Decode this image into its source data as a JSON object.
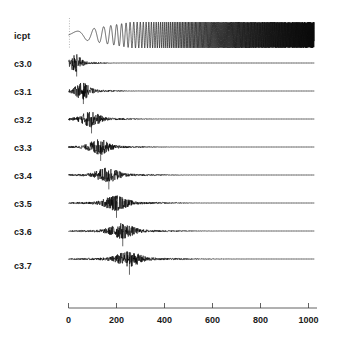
{
  "chart_data": {
    "type": "line",
    "title": "",
    "subtitle": "",
    "xlabel": "",
    "ylabel": "",
    "grid": false,
    "legend_position": "left-row-labels",
    "xlim": [
      0,
      1024
    ],
    "x_ticks": [
      0,
      200,
      400,
      600,
      800,
      1000
    ],
    "x_tick_labels": [
      "0",
      "200",
      "400",
      "600",
      "800",
      "1000"
    ],
    "panel_labels": [
      "icpt",
      "c3.0",
      "c3.1",
      "c3.2",
      "c3.3",
      "c3.4",
      "c3.5",
      "c3.6",
      "c3.7"
    ],
    "n_panels": 9,
    "series": [
      {
        "name": "icpt",
        "kind": "chirp",
        "x_start": 0,
        "x_end": 1024,
        "amplitude": 1.0,
        "freq_start": 0.006,
        "freq_end": 0.49,
        "has_vertical_marker": true,
        "vertical_marker_x": 4
      },
      {
        "name": "c3.0",
        "kind": "burst",
        "burst_center": 30,
        "burst_width": 48,
        "tail_end": 1024,
        "amplitude": 1.0,
        "spike_x": 34,
        "spike_depth": 1.5
      },
      {
        "name": "c3.1",
        "kind": "burst",
        "burst_center": 58,
        "burst_width": 62,
        "tail_end": 1024,
        "amplitude": 0.95,
        "spike_x": 62,
        "spike_depth": 1.45
      },
      {
        "name": "c3.2",
        "kind": "burst",
        "burst_center": 92,
        "burst_width": 78,
        "tail_end": 1024,
        "amplitude": 0.92,
        "spike_x": 96,
        "spike_depth": 1.6
      },
      {
        "name": "c3.3",
        "kind": "burst",
        "burst_center": 128,
        "burst_width": 86,
        "tail_end": 1024,
        "amplitude": 0.9,
        "spike_x": 134,
        "spike_depth": 1.55
      },
      {
        "name": "c3.4",
        "kind": "burst",
        "burst_center": 162,
        "burst_width": 94,
        "tail_end": 1024,
        "amplitude": 0.9,
        "spike_x": 168,
        "spike_depth": 1.6
      },
      {
        "name": "c3.5",
        "kind": "burst",
        "burst_center": 196,
        "burst_width": 100,
        "tail_end": 1024,
        "amplitude": 0.88,
        "spike_x": 200,
        "spike_depth": 1.65
      },
      {
        "name": "c3.6",
        "kind": "burst",
        "burst_center": 222,
        "burst_width": 104,
        "tail_end": 1024,
        "amplitude": 0.88,
        "spike_x": 226,
        "spike_depth": 1.7
      },
      {
        "name": "c3.7",
        "kind": "burst",
        "burst_center": 250,
        "burst_width": 112,
        "tail_end": 1024,
        "amplitude": 0.85,
        "spike_x": 254,
        "spike_depth": 1.75
      }
    ]
  },
  "colors": {
    "background": "#ffffff",
    "trace": "#000000",
    "baseline": "#8a8a8a",
    "axis": "#3a3a3a",
    "label": "#1a1a1a"
  },
  "axis": {
    "tick_labels": [
      "0",
      "200",
      "400",
      "600",
      "800",
      "1000"
    ]
  },
  "labels": {
    "icpt": "icpt",
    "c30": "c3.0",
    "c31": "c3.1",
    "c32": "c3.2",
    "c33": "c3.3",
    "c34": "c3.4",
    "c35": "c3.5",
    "c36": "c3.6",
    "c37": "c3.7"
  }
}
